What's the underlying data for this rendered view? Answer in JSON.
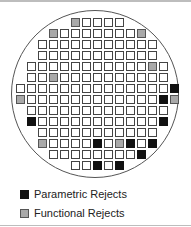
{
  "colors": {
    "parametric": "#111111",
    "functional": "#a9a9a9",
    "good": "#ffffff"
  },
  "grid": {
    "origin_x": 16,
    "origin_y": 18,
    "pitch": 11,
    "rows": [
      {
        "start": 5,
        "end": 9,
        "parametric": [],
        "functional": [
          5
        ]
      },
      {
        "start": 3,
        "end": 11,
        "parametric": [],
        "functional": [
          3,
          11
        ]
      },
      {
        "start": 2,
        "end": 12,
        "parametric": [],
        "functional": []
      },
      {
        "start": 2,
        "end": 12,
        "parametric": [],
        "functional": []
      },
      {
        "start": 1,
        "end": 13,
        "parametric": [],
        "functional": [
          12
        ]
      },
      {
        "start": 1,
        "end": 13,
        "parametric": [],
        "functional": [
          3
        ]
      },
      {
        "start": 0,
        "end": 14,
        "parametric": [
          14
        ],
        "functional": []
      },
      {
        "start": 0,
        "end": 14,
        "parametric": [
          13
        ],
        "functional": [
          0,
          14
        ]
      },
      {
        "start": 1,
        "end": 13,
        "parametric": [],
        "functional": []
      },
      {
        "start": 1,
        "end": 13,
        "parametric": [
          1,
          13
        ],
        "functional": []
      },
      {
        "start": 2,
        "end": 12,
        "parametric": [],
        "functional": []
      },
      {
        "start": 2,
        "end": 12,
        "parametric": [
          7,
          10,
          12
        ],
        "functional": [
          2,
          9
        ]
      },
      {
        "start": 3,
        "end": 11,
        "parametric": [
          11
        ],
        "functional": []
      },
      {
        "start": 5,
        "end": 9,
        "parametric": [
          7,
          9
        ],
        "functional": []
      }
    ]
  },
  "legend": {
    "items": [
      {
        "label": "Parametric Rejects",
        "type": "parametric"
      },
      {
        "label": "Functional Rejects",
        "type": "functional"
      }
    ]
  }
}
